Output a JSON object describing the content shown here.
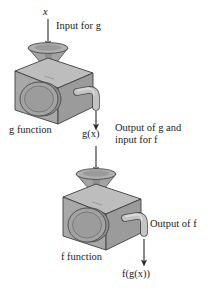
{
  "diagram": {
    "type": "function-composition-machine-diagram",
    "background_color": "#ffffff",
    "machine_colors": {
      "top_face": "#b9b9b9",
      "left_face": "#c9c9c9",
      "front_face": "#a6a6a6",
      "dial": "#9a9a9a",
      "dial_edge": "#6f6f6f",
      "funnel": "#a8a8a8",
      "funnel_rim": "#9c9c9c",
      "spout": "#c0c0c0",
      "outline": "#3a3a3a",
      "arrow": "#2b2b2b"
    },
    "labels": {
      "input_variable": "x",
      "input_for_g": "Input for g",
      "g_function": "g function",
      "intermediate_value": "g(x)",
      "output_of_g_line1": "Output of g and",
      "output_of_g_line2": "input for f",
      "output_of_f": "Output of f",
      "f_function": "f function",
      "final_value": "f(g(x))"
    },
    "machines": [
      {
        "name": "g-machine",
        "label": "g function",
        "input": "x",
        "output": "g(x)"
      },
      {
        "name": "f-machine",
        "label": "f function",
        "input": "g(x)",
        "output": "f(g(x))"
      }
    ],
    "arrows": [
      {
        "name": "input-arrow-x",
        "from": "x",
        "to": "g-machine-funnel",
        "direction": "down"
      },
      {
        "name": "arrow-gx-down-from-g",
        "from": "g-machine-spout",
        "to": "g(x)",
        "direction": "down"
      },
      {
        "name": "arrow-gx-into-f",
        "from": "g(x)",
        "to": "f-machine-funnel",
        "direction": "down"
      },
      {
        "name": "output-arrow-fgx",
        "from": "f-machine-spout",
        "to": "f(g(x))",
        "direction": "down"
      }
    ]
  }
}
